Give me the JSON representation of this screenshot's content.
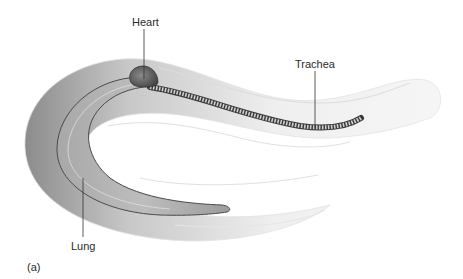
{
  "figure": {
    "panel_label": "(a)",
    "labels": {
      "heart": "Heart",
      "trachea": "Trachea",
      "lung": "Lung"
    }
  },
  "colors": {
    "body_dark": "#9a9a9a",
    "body_light": "#f4f4f4",
    "lung_fill": "#b8b8b8",
    "outline": "#555555",
    "trachea": "#5a5a5a",
    "leader_line": "#333333"
  }
}
